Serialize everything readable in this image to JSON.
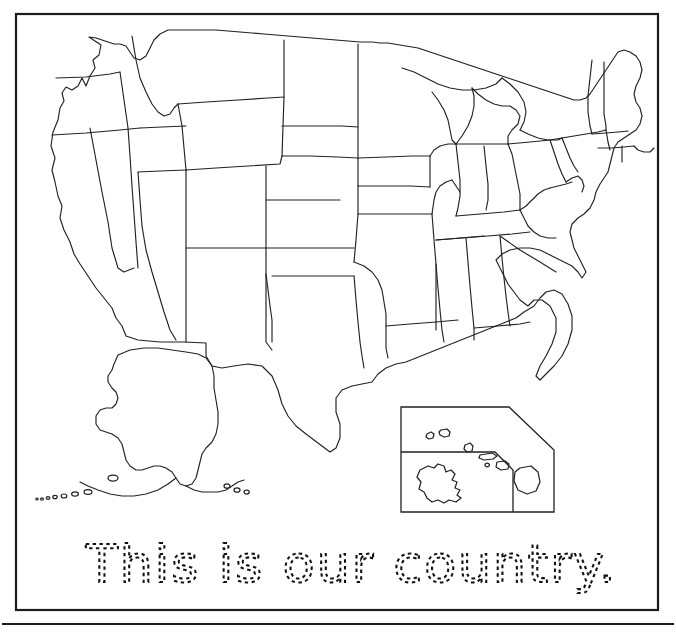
{
  "page": {
    "title": "This is our country.",
    "kind": "us-map-tracing-worksheet",
    "background_color": "#ffffff",
    "ink_color": "#222222",
    "frame_color": "#1b1b1b"
  },
  "frame": {
    "label": "worksheet-border",
    "x": 16,
    "y": 14,
    "width": 642,
    "height": 596
  },
  "bottom_rule": {
    "label": "page-footer-rule",
    "y": 624
  },
  "map": {
    "label": "united-states-outline-map",
    "description": "Blank outline map of the contiguous United States with state borders",
    "regions": [
      "contiguous-united-states",
      "alaska",
      "hawaii-inset"
    ]
  },
  "inset": {
    "label": "hawaii-inset-box",
    "x": 401,
    "y": 407,
    "width": 153,
    "height": 105,
    "contents": [
      "hawaiian-islands",
      "sub-inset-island"
    ]
  },
  "tracing_line": {
    "text": "This is our country.",
    "style": "dashed-trace-font",
    "x": 86,
    "baseline_y": 582
  }
}
